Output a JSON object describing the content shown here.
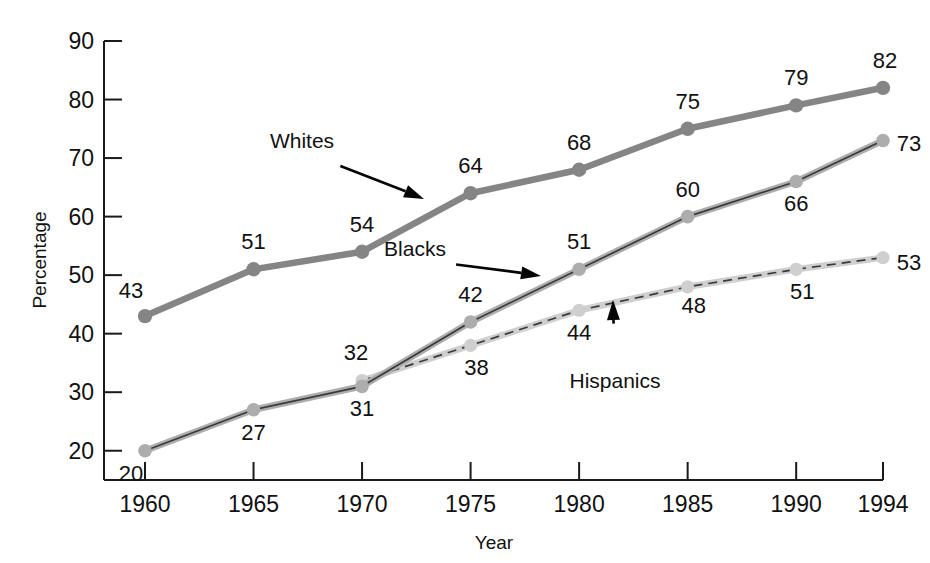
{
  "chart_data": {
    "type": "line",
    "title": "",
    "xlabel": "Year",
    "ylabel": "Percentage",
    "x": [
      1960,
      1965,
      1970,
      1975,
      1980,
      1985,
      1990,
      1994
    ],
    "categories": [
      "1960",
      "1965",
      "1970",
      "1975",
      "1980",
      "1985",
      "1990",
      "1994"
    ],
    "xlim": [
      1960,
      1994
    ],
    "ylim": [
      15,
      90
    ],
    "yticks": [
      20,
      30,
      40,
      50,
      60,
      70,
      80,
      90
    ],
    "ytick_labels": [
      "20",
      "30",
      "40",
      "50",
      "60",
      "70",
      "80",
      "90"
    ],
    "grid": false,
    "legend_position": "inline-annotations",
    "series": [
      {
        "name": "Whites",
        "color": "#858585",
        "style": "solid",
        "values": [
          43,
          51,
          54,
          64,
          68,
          75,
          79,
          82
        ],
        "value_labels": [
          "43",
          "51",
          "54",
          "64",
          "68",
          "75",
          "79",
          "82"
        ]
      },
      {
        "name": "Blacks",
        "color": "#adadad",
        "style": "solid-dark-core",
        "values": [
          20,
          27,
          31,
          42,
          51,
          60,
          66,
          73
        ],
        "value_labels": [
          "20",
          "27",
          "31",
          "42",
          "51",
          "60",
          "66",
          "73"
        ]
      },
      {
        "name": "Hispanics",
        "color": "#cfcfcf",
        "style": "dashed",
        "values": [
          null,
          null,
          32,
          38,
          44,
          48,
          51,
          53
        ],
        "value_labels": [
          "",
          "",
          "32",
          "38",
          "44",
          "48",
          "51",
          "53"
        ]
      }
    ],
    "annotations": [
      {
        "text": "Whites",
        "label_x": 302,
        "label_y": 148,
        "tip_x": 424,
        "tip_y": 199
      },
      {
        "text": "Blacks",
        "label_x": 415,
        "label_y": 256,
        "tip_x": 541,
        "tip_y": 276
      },
      {
        "text": "Hispanics",
        "label_x": 615,
        "label_y": 388,
        "tip_x": 613,
        "tip_y": 300
      }
    ]
  },
  "axes": {
    "y_title": "Percentage",
    "x_title": "Year"
  },
  "colors": {
    "whites": "#858585",
    "blacks": "#adadad",
    "hispanics": "#cfcfcf",
    "axis": "#1a1a1a",
    "text": "#111111",
    "background": "#ffffff"
  }
}
